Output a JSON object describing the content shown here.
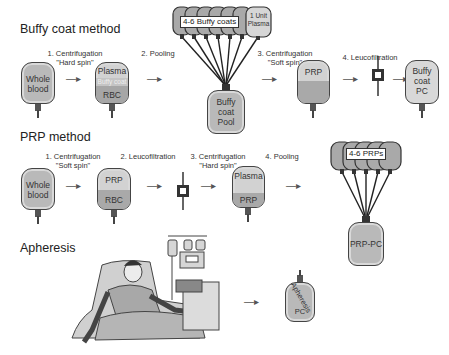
{
  "sections": {
    "buffy": {
      "title": "Buffy coat method",
      "steps": [
        {
          "line1": "1. Centrifugation",
          "line2": "\"Hard spin\""
        },
        {
          "line1": "2. Pooling",
          "line2": ""
        },
        {
          "line1": "3. Centrifugation",
          "line2": "\"Soft spin\""
        },
        {
          "line1": "4. Leucofiltration",
          "line2": ""
        }
      ],
      "bags": {
        "whole_blood": "Whole\nblood",
        "whole_blood_l1": "Whole",
        "whole_blood_l2": "blood",
        "sep_top": "Plasma",
        "sep_mid": "Buffy coat",
        "sep_bottom": "RBC",
        "pool_group": "4-6 Buffy coats",
        "plasma_unit_l1": "1 Unit",
        "plasma_unit_l2": "Plasma",
        "pool_l1": "Buffy",
        "pool_l2": "coat",
        "pool_l3": "Pool",
        "prp": "PRP",
        "final_l1": "Buffy",
        "final_l2": "coat",
        "final_l3": "PC"
      }
    },
    "prp": {
      "title": "PRP method",
      "steps": [
        {
          "line1": "1. Centrifugation",
          "line2": "\"Soft spin\""
        },
        {
          "line1": "2. Leucofiltration",
          "line2": ""
        },
        {
          "line1": "3. Centrifugation",
          "line2": "\"Hard spin\""
        },
        {
          "line1": "4. Pooling",
          "line2": ""
        }
      ],
      "bags": {
        "whole_blood_l1": "Whole",
        "whole_blood_l2": "blood",
        "sep_top": "PRP",
        "sep_bottom": "RBC",
        "spun_top": "Plasma",
        "spun_bottom": "PRP",
        "pool_group": "4-6 PRPs",
        "final": "PRP-PC"
      }
    },
    "apheresis": {
      "title": "Apheresis",
      "final_l1": "Apheresis",
      "final_l2": "PC"
    }
  },
  "arrow_glyph": "—▸",
  "colors": {
    "bag_fill": "#b9b9b9",
    "bag_light": "#d8d8d8",
    "bag_border": "#444444",
    "rbc_fill": "#a3a3a3",
    "buffy_fill": "#c9c9c9"
  }
}
